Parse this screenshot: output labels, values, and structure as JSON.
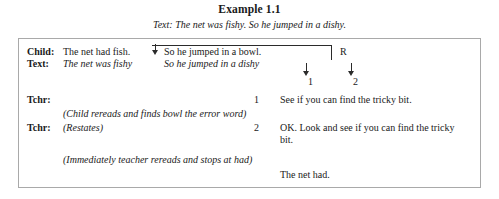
{
  "header": {
    "title": "Example 1.1",
    "subtitle": "Text: The net was fishy. So he jumped in a dishy."
  },
  "transcript": {
    "rows": [
      {
        "speaker": "Child:",
        "text_plain": "The net had fish.",
        "text_boxed": "So he jumped in a bowl.",
        "code": "R"
      },
      {
        "speaker": "Text:",
        "text_plain": "The net was fishy",
        "text_boxed": "So he jumped in a dishy"
      },
      {
        "speaker": "Tchr:",
        "number": "1",
        "speech": "See if you can find the tricky bit."
      },
      {
        "stage_direction": "(Child rereads and finds bowl the error word)"
      },
      {
        "speaker": "Tchr:",
        "action": "(Restates)",
        "number": "2",
        "speech": "OK. Look and see if you can find the tricky bit."
      },
      {
        "stage_direction": "(Immediately teacher rereads and stops at had)"
      },
      {
        "final_line": "The net had."
      }
    ],
    "arrow_labels": {
      "first": "1",
      "second": "2"
    }
  }
}
